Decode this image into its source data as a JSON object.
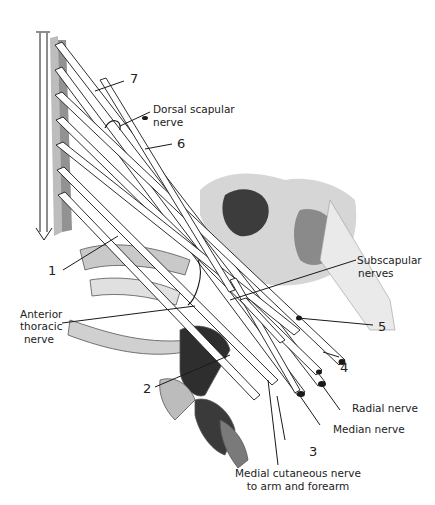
{
  "figure": {
    "colors": {
      "ink": "#1a1a1a",
      "background": "#ffffff",
      "shade": "#3a3a3a"
    }
  },
  "labels": {
    "num_7": "7",
    "dorsal_scapular_1": "Dorsal scapular",
    "dorsal_scapular_2": "nerve",
    "num_6": "6",
    "num_1": "1",
    "subscapular_1": "Subscapular",
    "subscapular_2": "nerves",
    "anterior_thoracic_1": "Anterior",
    "anterior_thoracic_2": "thoracic",
    "anterior_thoracic_3": "nerve",
    "num_5": "5",
    "num_4": "4",
    "num_2": "2",
    "radial": "Radial nerve",
    "median": "Median nerve",
    "num_3": "3",
    "medial_cutaneous_1": "Medial cutaneous nerve",
    "medial_cutaneous_2": "to arm and forearm"
  }
}
